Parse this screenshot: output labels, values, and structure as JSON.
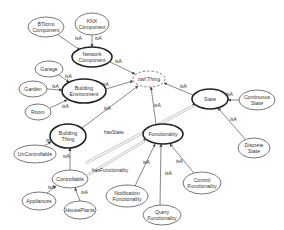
{
  "diagram": {
    "title": "",
    "nodes": [
      {
        "id": "bticino",
        "lines": [
          "BTicino",
          "Component"
        ],
        "x": 46,
        "y": 27,
        "rx": 18,
        "ry": 10,
        "style": "normal"
      },
      {
        "id": "knx",
        "lines": [
          "KNX",
          "Component"
        ],
        "x": 92,
        "y": 24,
        "rx": 17,
        "ry": 11,
        "style": "normal"
      },
      {
        "id": "network",
        "lines": [
          "Network",
          "Component"
        ],
        "x": 92,
        "y": 57,
        "rx": 20,
        "ry": 10,
        "style": "bold"
      },
      {
        "id": "owlthing",
        "lines": [
          "owl:Thing"
        ],
        "x": 149,
        "y": 79,
        "rx": 16,
        "ry": 8,
        "style": "dashed"
      },
      {
        "id": "garage",
        "lines": [
          "Garage"
        ],
        "x": 49,
        "y": 69,
        "rx": 14,
        "ry": 8,
        "style": "normal"
      },
      {
        "id": "garden",
        "lines": [
          "Garden"
        ],
        "x": 33,
        "y": 89,
        "rx": 14,
        "ry": 8,
        "style": "normal"
      },
      {
        "id": "buildingenv",
        "lines": [
          "Building",
          "Environment"
        ],
        "x": 84,
        "y": 91,
        "rx": 22,
        "ry": 12,
        "style": "bold"
      },
      {
        "id": "room",
        "lines": [
          "Room"
        ],
        "x": 38,
        "y": 112,
        "rx": 13,
        "ry": 8,
        "style": "normal"
      },
      {
        "id": "state",
        "lines": [
          "State"
        ],
        "x": 210,
        "y": 99,
        "rx": 18,
        "ry": 10,
        "style": "bold"
      },
      {
        "id": "continuous",
        "lines": [
          "Continuous",
          "State"
        ],
        "x": 257,
        "y": 100,
        "rx": 18,
        "ry": 10,
        "style": "normal"
      },
      {
        "id": "discrete",
        "lines": [
          "Discrete",
          "State"
        ],
        "x": 254,
        "y": 148,
        "rx": 16,
        "ry": 10,
        "style": "normal"
      },
      {
        "id": "buildingthing",
        "lines": [
          "Building",
          "Thing"
        ],
        "x": 68,
        "y": 136,
        "rx": 18,
        "ry": 12,
        "style": "bold"
      },
      {
        "id": "functionality",
        "lines": [
          "Functionality"
        ],
        "x": 163,
        "y": 134,
        "rx": 20,
        "ry": 10,
        "style": "bold"
      },
      {
        "id": "uncontrollable",
        "lines": [
          "UnControllable"
        ],
        "x": 35,
        "y": 154,
        "rx": 21,
        "ry": 9,
        "style": "normal"
      },
      {
        "id": "controllable",
        "lines": [
          "Controllable"
        ],
        "x": 70,
        "y": 179,
        "rx": 18,
        "ry": 9,
        "style": "normal"
      },
      {
        "id": "notification",
        "lines": [
          "Notification",
          "Functionality"
        ],
        "x": 127,
        "y": 196,
        "rx": 21,
        "ry": 11,
        "style": "normal"
      },
      {
        "id": "query",
        "lines": [
          "Query",
          "Functionality"
        ],
        "x": 162,
        "y": 215,
        "rx": 19,
        "ry": 10,
        "style": "normal"
      },
      {
        "id": "control",
        "lines": [
          "Control",
          "Functionality"
        ],
        "x": 202,
        "y": 183,
        "rx": 19,
        "ry": 11,
        "style": "normal"
      },
      {
        "id": "appliances",
        "lines": [
          "Appliances"
        ],
        "x": 39,
        "y": 201,
        "rx": 17,
        "ry": 9,
        "style": "normal"
      },
      {
        "id": "houseplants",
        "lines": [
          "HousePlants"
        ],
        "x": 80,
        "y": 210,
        "rx": 16,
        "ry": 9,
        "style": "normal"
      }
    ],
    "edges": [
      {
        "from": "bticino",
        "to": "network",
        "label": "isA",
        "lx": 75,
        "ly": 40,
        "x1": 58,
        "y1": 35,
        "x2": 80,
        "y2": 50
      },
      {
        "from": "knx",
        "to": "network",
        "label": "isA",
        "lx": 95,
        "ly": 40,
        "x1": 92,
        "y1": 35,
        "x2": 92,
        "y2": 47
      },
      {
        "from": "network",
        "to": "owlthing",
        "label": "isA",
        "lx": 115,
        "ly": 63,
        "x1": 110,
        "y1": 62,
        "x2": 135,
        "y2": 74
      },
      {
        "from": "garage",
        "to": "buildingenv",
        "label": "isA",
        "lx": 65,
        "ly": 78,
        "x1": 59,
        "y1": 75,
        "x2": 69,
        "y2": 82
      },
      {
        "from": "garden",
        "to": "buildingenv",
        "label": "isA",
        "lx": 52,
        "ly": 88,
        "x1": 47,
        "y1": 89,
        "x2": 62,
        "y2": 90
      },
      {
        "from": "room",
        "to": "buildingenv",
        "label": "isA",
        "lx": 62,
        "ly": 108,
        "x1": 50,
        "y1": 108,
        "x2": 67,
        "y2": 100
      },
      {
        "from": "buildingenv",
        "to": "owlthing",
        "label": "isA",
        "lx": 102,
        "ly": 86,
        "x1": 106,
        "y1": 89,
        "x2": 133,
        "y2": 81
      },
      {
        "from": "state",
        "to": "owlthing",
        "label": "isA",
        "lx": 180,
        "ly": 88,
        "x1": 193,
        "y1": 95,
        "x2": 164,
        "y2": 83
      },
      {
        "from": "functionality",
        "to": "owlthing",
        "label": "isA",
        "lx": 154,
        "ly": 107,
        "x1": 156,
        "y1": 124,
        "x2": 151,
        "y2": 87
      },
      {
        "from": "buildingthing",
        "to": "owlthing",
        "label": "isA",
        "lx": 104,
        "ly": 110,
        "x1": 82,
        "y1": 128,
        "x2": 138,
        "y2": 86
      },
      {
        "from": "continuous",
        "to": "state",
        "label": "isA",
        "lx": 226,
        "ly": 96,
        "x1": 239,
        "y1": 100,
        "x2": 228,
        "y2": 100
      },
      {
        "from": "discrete",
        "to": "state",
        "label": "isA",
        "lx": 230,
        "ly": 121,
        "x1": 245,
        "y1": 139,
        "x2": 218,
        "y2": 108
      },
      {
        "from": "uncontrollable",
        "to": "buildingthing",
        "label": "isA",
        "lx": 46,
        "ly": 142,
        "x1": 44,
        "y1": 146,
        "x2": 51,
        "y2": 142
      },
      {
        "from": "controllable",
        "to": "buildingthing",
        "label": "isA",
        "lx": 63,
        "ly": 158,
        "x1": 70,
        "y1": 170,
        "x2": 70,
        "y2": 148
      },
      {
        "from": "appliances",
        "to": "controllable",
        "label": "isA",
        "lx": 48,
        "ly": 189,
        "x1": 47,
        "y1": 193,
        "x2": 56,
        "y2": 186
      },
      {
        "from": "houseplants",
        "to": "controllable",
        "label": "isA",
        "lx": 81,
        "ly": 194,
        "x1": 80,
        "y1": 201,
        "x2": 75,
        "y2": 188
      },
      {
        "from": "notification",
        "to": "functionality",
        "label": "isA",
        "lx": 143,
        "ly": 164,
        "x1": 135,
        "y1": 186,
        "x2": 155,
        "y2": 144
      },
      {
        "from": "query",
        "to": "functionality",
        "label": "isA",
        "lx": 165,
        "ly": 175,
        "x1": 160,
        "y1": 205,
        "x2": 161,
        "y2": 144
      },
      {
        "from": "control",
        "to": "functionality",
        "label": "isA",
        "lx": 176,
        "ly": 163,
        "x1": 194,
        "y1": 173,
        "x2": 170,
        "y2": 144
      }
    ],
    "relations": [
      {
        "from": "buildingthing",
        "to": "state",
        "label": "hasState",
        "lx": 104,
        "ly": 134,
        "x1": 86,
        "y1": 163,
        "x2": 195,
        "y2": 105
      },
      {
        "from": "controllable",
        "to": "functionality",
        "label": "hasFunctionality",
        "lx": 92,
        "ly": 172,
        "x1": 88,
        "y1": 175,
        "x2": 146,
        "y2": 140
      }
    ]
  }
}
